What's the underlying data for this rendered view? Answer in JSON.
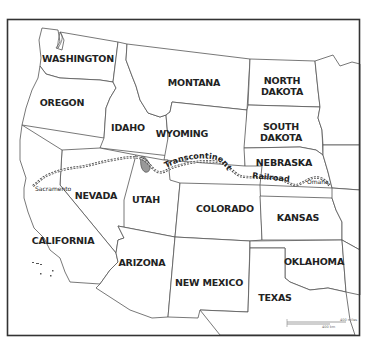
{
  "map": {
    "title": "Western United States with Transcontinental Railroad",
    "states": [
      {
        "id": "washington",
        "label": "WASHINGTON",
        "x": 78,
        "y": 62
      },
      {
        "id": "oregon",
        "label": "OREGON",
        "x": 62,
        "y": 106
      },
      {
        "id": "idaho",
        "label": "IDAHO",
        "x": 128,
        "y": 131
      },
      {
        "id": "montana",
        "label": "MONTANA",
        "x": 194,
        "y": 86
      },
      {
        "id": "wyoming",
        "label": "WYOMING",
        "x": 182,
        "y": 137
      },
      {
        "id": "north_dakota",
        "label_line1": "NORTH",
        "label_line2": "DAKOTA",
        "x": 282,
        "y": 83
      },
      {
        "id": "south_dakota",
        "label_line1": "SOUTH",
        "label_line2": "DAKOTA",
        "x": 281,
        "y": 129
      },
      {
        "id": "nebraska",
        "label": "NEBRASKA",
        "x": 284,
        "y": 166
      },
      {
        "id": "nevada",
        "label": "NEVADA",
        "x": 96,
        "y": 199
      },
      {
        "id": "utah",
        "label": "UTAH",
        "x": 146,
        "y": 203
      },
      {
        "id": "colorado",
        "label": "COLORADO",
        "x": 225,
        "y": 212
      },
      {
        "id": "kansas",
        "label": "KANSAS",
        "x": 298,
        "y": 221
      },
      {
        "id": "california",
        "label": "CALIFORNIA",
        "x": 63,
        "y": 243
      },
      {
        "id": "arizona",
        "label": "ARIZONA",
        "x": 142,
        "y": 266
      },
      {
        "id": "new_mexico",
        "label": "NEW MEXICO",
        "x": 209,
        "y": 286
      },
      {
        "id": "oklahoma",
        "label": "OKLAHOMA",
        "x": 314,
        "y": 265
      },
      {
        "id": "texas",
        "label": "TEXAS",
        "x": 275,
        "y": 301
      }
    ],
    "cities": [
      {
        "name": "Sacramento",
        "x": 35,
        "y": 190
      },
      {
        "name": "Omaha",
        "x": 309,
        "y": 182
      }
    ],
    "railroad": {
      "label_line1": "Transcontinental",
      "label_line2": "Railroad"
    },
    "scale_bar": {
      "miles_label": "400 miles",
      "km_label": "400 km"
    },
    "colors": {
      "state_fill": "#ffffff",
      "border": "#555555",
      "frame": "#333333",
      "railroad": "#444444",
      "lake": "#999999",
      "text": "#222222"
    }
  }
}
